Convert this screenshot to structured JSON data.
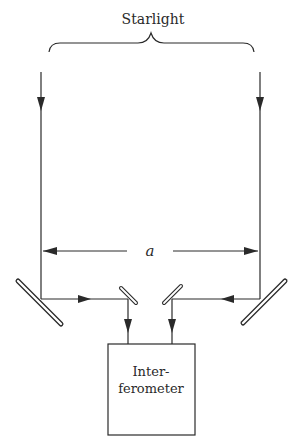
{
  "diagram": {
    "title_label": "Starlight",
    "baseline_label": "a",
    "box_label_line1": "Inter-",
    "box_label_line2": "ferometer",
    "colors": {
      "ink": "#2a2a2a",
      "background": "#ffffff"
    },
    "components": [
      {
        "id": "left-beam",
        "type": "incoming-light-ray"
      },
      {
        "id": "right-beam",
        "type": "incoming-light-ray"
      },
      {
        "id": "left-outer-mirror",
        "type": "mirror"
      },
      {
        "id": "right-outer-mirror",
        "type": "mirror"
      },
      {
        "id": "left-inner-mirror",
        "type": "mirror"
      },
      {
        "id": "right-inner-mirror",
        "type": "mirror"
      },
      {
        "id": "interferometer-box",
        "type": "instrument"
      }
    ]
  }
}
